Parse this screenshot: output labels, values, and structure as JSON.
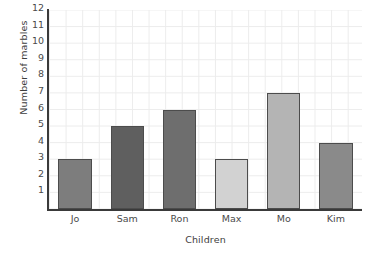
{
  "chart_data": {
    "type": "bar",
    "title": "",
    "xlabel": "Children",
    "ylabel": "Number of marbles",
    "categories": [
      "Jo",
      "Sam",
      "Ron",
      "Max",
      "Mo",
      "Kim"
    ],
    "values": [
      3,
      5,
      6,
      3,
      7,
      4
    ],
    "ylim": [
      0,
      12
    ],
    "yticks": [
      1,
      2,
      3,
      4,
      5,
      6,
      7,
      8,
      9,
      10,
      11,
      12
    ],
    "ytick_labels": [
      "1",
      "2",
      "3",
      "4",
      "5",
      "6",
      "7",
      "8",
      "9",
      "10",
      "11",
      "12"
    ],
    "grid": true,
    "legend": false,
    "bar_colors": [
      "#7d7d7d",
      "#5f5f5f",
      "#6e6e6e",
      "#d2d2d2",
      "#b4b4b4",
      "#8a8a8a"
    ],
    "bar_border_color": "#4c4c4c",
    "axis_color": "#3a3a3a",
    "grid_color": "#ececec",
    "background_color": "#ffffff",
    "text_color": "#4a4a4a"
  }
}
